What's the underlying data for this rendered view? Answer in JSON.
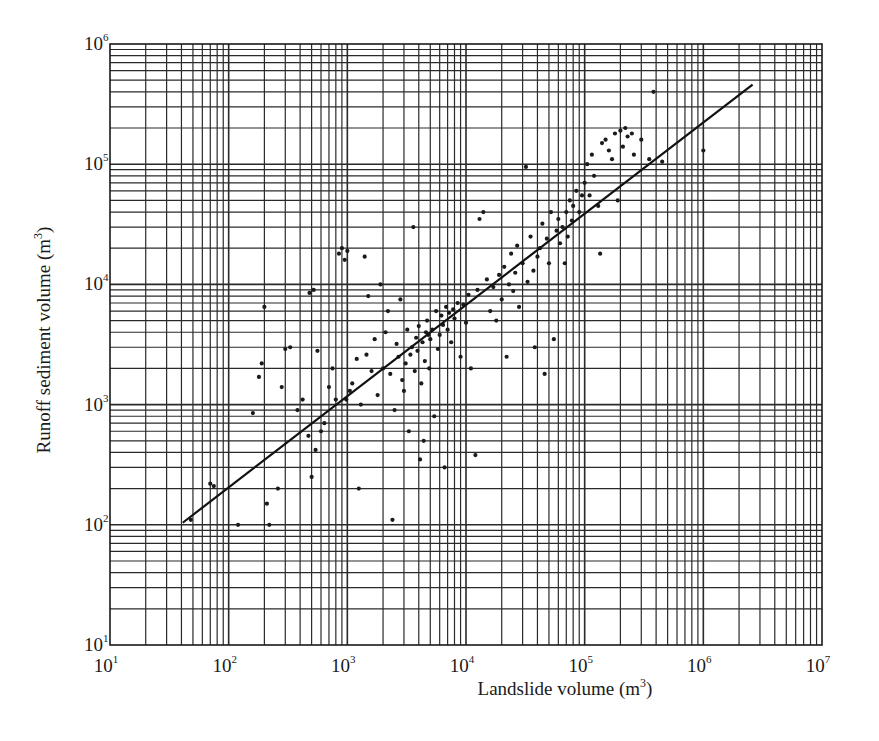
{
  "chart_data": {
    "type": "scatter",
    "title": "",
    "xlabel": "Landslide volume (m³)",
    "ylabel": "Runoff sediment volume (m³)",
    "xlabel_parts": {
      "text": "Landslide volume (m",
      "exp": "3",
      "close": ")"
    },
    "ylabel_parts": {
      "text": "Runoff sediment volume (m",
      "exp": "3",
      "close": ")"
    },
    "xscale": "log",
    "yscale": "log",
    "xlim": [
      10,
      10000000
    ],
    "ylim": [
      10,
      1000000
    ],
    "grid": "log-log full grid (major and minor)",
    "legend": "none",
    "x_ticks": [
      {
        "base": "10",
        "exp": "1"
      },
      {
        "base": "10",
        "exp": "2"
      },
      {
        "base": "10",
        "exp": "3"
      },
      {
        "base": "10",
        "exp": "4"
      },
      {
        "base": "10",
        "exp": "5"
      },
      {
        "base": "10",
        "exp": "6"
      },
      {
        "base": "10",
        "exp": "7"
      }
    ],
    "y_ticks": [
      {
        "base": "10",
        "exp": "1"
      },
      {
        "base": "10",
        "exp": "2"
      },
      {
        "base": "10",
        "exp": "3"
      },
      {
        "base": "10",
        "exp": "4"
      },
      {
        "base": "10",
        "exp": "5"
      },
      {
        "base": "10",
        "exp": "6"
      }
    ],
    "regression_line": {
      "start": {
        "x": 41,
        "y": 104
      },
      "end": {
        "x": 2600000,
        "y": 460000
      },
      "approx_slope_loglog": 0.76
    },
    "series": [
      {
        "name": "observations",
        "points": [
          [
            48,
            110
          ],
          [
            70,
            220
          ],
          [
            75,
            210
          ],
          [
            120,
            100
          ],
          [
            160,
            850
          ],
          [
            180,
            1700
          ],
          [
            190,
            2200
          ],
          [
            200,
            6500
          ],
          [
            210,
            150
          ],
          [
            220,
            100
          ],
          [
            260,
            200
          ],
          [
            280,
            1400
          ],
          [
            300,
            2900
          ],
          [
            330,
            3000
          ],
          [
            380,
            900
          ],
          [
            420,
            1100
          ],
          [
            470,
            550
          ],
          [
            480,
            8500
          ],
          [
            500,
            250
          ],
          [
            520,
            9000
          ],
          [
            540,
            420
          ],
          [
            560,
            2800
          ],
          [
            600,
            600
          ],
          [
            640,
            700
          ],
          [
            700,
            1400
          ],
          [
            750,
            2000
          ],
          [
            800,
            1100
          ],
          [
            850,
            18000
          ],
          [
            900,
            20000
          ],
          [
            950,
            16000
          ],
          [
            980,
            1100
          ],
          [
            1000,
            19000
          ],
          [
            1050,
            1300
          ],
          [
            1100,
            1500
          ],
          [
            1200,
            2400
          ],
          [
            1250,
            200
          ],
          [
            1300,
            1000
          ],
          [
            1400,
            17000
          ],
          [
            1450,
            2600
          ],
          [
            1500,
            8000
          ],
          [
            1600,
            1900
          ],
          [
            1700,
            3500
          ],
          [
            1800,
            1200
          ],
          [
            1900,
            10000
          ],
          [
            2000,
            2000
          ],
          [
            2100,
            4000
          ],
          [
            2200,
            6000
          ],
          [
            2300,
            1800
          ],
          [
            2400,
            110
          ],
          [
            2500,
            900
          ],
          [
            2600,
            3200
          ],
          [
            2700,
            2500
          ],
          [
            2800,
            7500
          ],
          [
            2900,
            1600
          ],
          [
            3000,
            1300
          ],
          [
            3100,
            2200
          ],
          [
            3200,
            4200
          ],
          [
            3300,
            600
          ],
          [
            3400,
            2600
          ],
          [
            3500,
            3000
          ],
          [
            3600,
            30000
          ],
          [
            3700,
            1900
          ],
          [
            3800,
            3600
          ],
          [
            3900,
            2800
          ],
          [
            4000,
            4500
          ],
          [
            4100,
            350
          ],
          [
            4200,
            1500
          ],
          [
            4300,
            3300
          ],
          [
            4400,
            500
          ],
          [
            4500,
            2300
          ],
          [
            4600,
            4000
          ],
          [
            4700,
            5000
          ],
          [
            4800,
            3800
          ],
          [
            4900,
            2000
          ],
          [
            5000,
            3500
          ],
          [
            5200,
            4200
          ],
          [
            5400,
            800
          ],
          [
            5600,
            6000
          ],
          [
            5800,
            2900
          ],
          [
            6000,
            3800
          ],
          [
            6200,
            5500
          ],
          [
            6400,
            4600
          ],
          [
            6600,
            300
          ],
          [
            6800,
            6500
          ],
          [
            7000,
            4200
          ],
          [
            7200,
            5800
          ],
          [
            7500,
            3300
          ],
          [
            7800,
            6200
          ],
          [
            8000,
            5200
          ],
          [
            8500,
            7000
          ],
          [
            9000,
            2500
          ],
          [
            9500,
            6800
          ],
          [
            10000,
            4800
          ],
          [
            10500,
            8200
          ],
          [
            11000,
            2000
          ],
          [
            12000,
            380
          ],
          [
            12500,
            9000
          ],
          [
            13000,
            35000
          ],
          [
            14000,
            40000
          ],
          [
            15000,
            11000
          ],
          [
            16000,
            6000
          ],
          [
            17000,
            9500
          ],
          [
            18000,
            5000
          ],
          [
            19000,
            12000
          ],
          [
            20000,
            7500
          ],
          [
            21000,
            14000
          ],
          [
            22000,
            2500
          ],
          [
            23000,
            10000
          ],
          [
            24000,
            18000
          ],
          [
            25000,
            8800
          ],
          [
            26000,
            12500
          ],
          [
            27000,
            21000
          ],
          [
            28000,
            6500
          ],
          [
            30000,
            15000
          ],
          [
            32000,
            95000
          ],
          [
            33000,
            10500
          ],
          [
            35000,
            25000
          ],
          [
            37000,
            13000
          ],
          [
            38000,
            3000
          ],
          [
            40000,
            17000
          ],
          [
            42000,
            20000
          ],
          [
            44000,
            32000
          ],
          [
            46000,
            1800
          ],
          [
            48000,
            24000
          ],
          [
            50000,
            15000
          ],
          [
            52000,
            40000
          ],
          [
            55000,
            3500
          ],
          [
            58000,
            28000
          ],
          [
            60000,
            35000
          ],
          [
            62000,
            22000
          ],
          [
            65000,
            30000
          ],
          [
            68000,
            15000
          ],
          [
            70000,
            40000
          ],
          [
            72000,
            25000
          ],
          [
            75000,
            50000
          ],
          [
            78000,
            34000
          ],
          [
            80000,
            45000
          ],
          [
            85000,
            60000
          ],
          [
            90000,
            40000
          ],
          [
            95000,
            55000
          ],
          [
            100000,
            70000
          ],
          [
            105000,
            100000
          ],
          [
            110000,
            55000
          ],
          [
            115000,
            120000
          ],
          [
            120000,
            80000
          ],
          [
            130000,
            45000
          ],
          [
            135000,
            18000
          ],
          [
            140000,
            150000
          ],
          [
            150000,
            160000
          ],
          [
            160000,
            130000
          ],
          [
            170000,
            110000
          ],
          [
            180000,
            180000
          ],
          [
            190000,
            50000
          ],
          [
            200000,
            190000
          ],
          [
            210000,
            140000
          ],
          [
            220000,
            200000
          ],
          [
            230000,
            170000
          ],
          [
            250000,
            180000
          ],
          [
            260000,
            120000
          ],
          [
            300000,
            160000
          ],
          [
            350000,
            110000
          ],
          [
            380000,
            400000
          ],
          [
            450000,
            105000
          ],
          [
            1000000,
            130000
          ]
        ]
      }
    ]
  },
  "figure": {
    "frame_color": "#1a1a1a",
    "grid_color": "#2a2a2a",
    "marker_color": "#1a1a1a",
    "line_color": "#111111",
    "background": "#ffffff"
  }
}
